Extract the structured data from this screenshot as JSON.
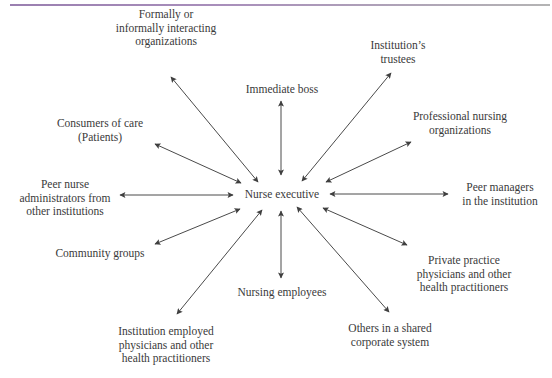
{
  "diagram": {
    "type": "hub-and-spoke",
    "center": {
      "label": "Nurse executive",
      "x": 282,
      "y": 194
    },
    "colors": {
      "text": "#3a3a3a",
      "arrow": "#4a4a4a",
      "top_rule_start": "#9a7fb0",
      "top_rule_end": "#b4b4b4"
    },
    "nodes": [
      {
        "id": "formally",
        "lines": [
          "Formally or",
          "informally interacting",
          "organizations"
        ],
        "x": 166,
        "y": 8,
        "direction": "bidirectional"
      },
      {
        "id": "immediate-boss",
        "lines": [
          "Immediate boss"
        ],
        "x": 282,
        "y": 83,
        "direction": "bidirectional"
      },
      {
        "id": "trustees",
        "lines": [
          "Institution’s",
          "trustees"
        ],
        "x": 398,
        "y": 39,
        "direction": "bidirectional"
      },
      {
        "id": "consumers",
        "lines": [
          "Consumers of care",
          "(Patients)"
        ],
        "x": 100,
        "y": 117,
        "direction": "bidirectional"
      },
      {
        "id": "professional",
        "lines": [
          "Professional nursing",
          "organizations"
        ],
        "x": 460,
        "y": 110,
        "direction": "bidirectional"
      },
      {
        "id": "peer-nurse",
        "lines": [
          "Peer nurse",
          "administrators from",
          "other institutions"
        ],
        "x": 65,
        "y": 178,
        "direction": "bidirectional"
      },
      {
        "id": "peer-managers",
        "lines": [
          "Peer managers",
          "in the institution"
        ],
        "x": 500,
        "y": 181,
        "direction": "bidirectional"
      },
      {
        "id": "community",
        "lines": [
          "Community groups"
        ],
        "x": 100,
        "y": 247,
        "direction": "bidirectional"
      },
      {
        "id": "private",
        "lines": [
          "Private practice",
          "physicians and other",
          "health practitioners"
        ],
        "x": 464,
        "y": 254,
        "direction": "bidirectional"
      },
      {
        "id": "nursing-employees",
        "lines": [
          "Nursing employees"
        ],
        "x": 282,
        "y": 286,
        "direction": "bidirectional"
      },
      {
        "id": "inst-employed",
        "lines": [
          "Institution employed",
          "physicians and other",
          "health practitioners"
        ],
        "x": 166,
        "y": 325,
        "direction": "bidirectional"
      },
      {
        "id": "others-shared",
        "lines": [
          "Others in a shared",
          "corporate system"
        ],
        "x": 390,
        "y": 322,
        "direction": "bidirectional"
      }
    ],
    "edges": [
      {
        "to": "formally",
        "x1": 258,
        "y1": 182,
        "x2": 171,
        "y2": 77
      },
      {
        "to": "immediate-boss",
        "x1": 281,
        "y1": 175,
        "x2": 281,
        "y2": 101
      },
      {
        "to": "trustees",
        "x1": 302,
        "y1": 181,
        "x2": 391,
        "y2": 73
      },
      {
        "to": "consumers",
        "x1": 241,
        "y1": 183,
        "x2": 155,
        "y2": 144
      },
      {
        "to": "professional",
        "x1": 326,
        "y1": 182,
        "x2": 411,
        "y2": 142
      },
      {
        "to": "peer-nurse",
        "x1": 233,
        "y1": 195,
        "x2": 120,
        "y2": 195
      },
      {
        "to": "peer-managers",
        "x1": 330,
        "y1": 194,
        "x2": 448,
        "y2": 194
      },
      {
        "to": "community",
        "x1": 240,
        "y1": 209,
        "x2": 155,
        "y2": 244
      },
      {
        "to": "private",
        "x1": 323,
        "y1": 208,
        "x2": 407,
        "y2": 245
      },
      {
        "to": "nursing-employees",
        "x1": 281,
        "y1": 211,
        "x2": 281,
        "y2": 278
      },
      {
        "to": "inst-employed",
        "x1": 262,
        "y1": 210,
        "x2": 177,
        "y2": 314
      },
      {
        "to": "others-shared",
        "x1": 297,
        "y1": 207,
        "x2": 389,
        "y2": 312
      }
    ]
  }
}
